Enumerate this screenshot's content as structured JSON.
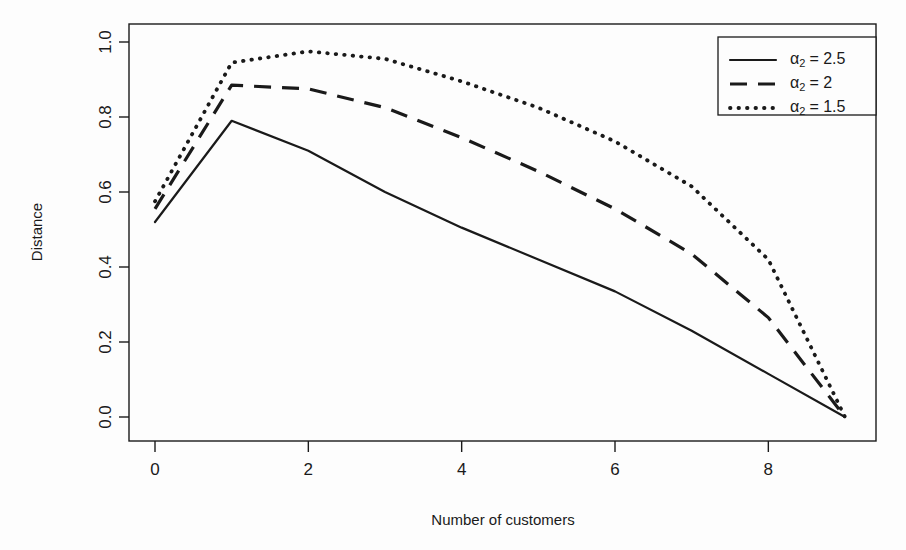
{
  "chart_data": {
    "type": "line",
    "title": "",
    "xlabel": "Number of customers",
    "ylabel": "Distance",
    "xlim": [
      0,
      9
    ],
    "ylim": [
      0.0,
      1.0
    ],
    "xticks": [
      0,
      2,
      4,
      6,
      8
    ],
    "xticklabels": [
      "0",
      "2",
      "4",
      "6",
      "8"
    ],
    "yticks": [
      0.0,
      0.2,
      0.4,
      0.6,
      0.8,
      1.0
    ],
    "yticklabels": [
      "0.0",
      "0.2",
      "0.4",
      "0.6",
      "0.8",
      "1.0"
    ],
    "grid": false,
    "legend_position": "top-right",
    "x": [
      0,
      1,
      2,
      3,
      4,
      5,
      6,
      7,
      8,
      9
    ],
    "series": [
      {
        "name": "alpha_2 = 2.5",
        "label_prefix": "α",
        "label_sub": "2",
        "label_suffix": "= 2.5",
        "linestyle": "solid",
        "color": "#1a1a1a",
        "values": [
          0.52,
          0.79,
          0.71,
          0.6,
          0.505,
          0.42,
          0.335,
          0.23,
          0.115,
          0.0
        ]
      },
      {
        "name": "alpha_2 = 2",
        "label_prefix": "α",
        "label_sub": "2",
        "label_suffix": "= 2",
        "linestyle": "dashed",
        "color": "#1a1a1a",
        "values": [
          0.555,
          0.885,
          0.875,
          0.825,
          0.745,
          0.655,
          0.555,
          0.435,
          0.265,
          0.0
        ]
      },
      {
        "name": "alpha_2 = 1.5",
        "label_prefix": "α",
        "label_sub": "2",
        "label_suffix": "= 1.5",
        "linestyle": "dotted",
        "color": "#1a1a1a",
        "values": [
          0.575,
          0.945,
          0.975,
          0.955,
          0.895,
          0.825,
          0.735,
          0.615,
          0.42,
          0.0
        ]
      }
    ]
  },
  "axes": {
    "xlabel": "Number of customers",
    "ylabel": "Distance"
  },
  "legend": {
    "entries": [
      {
        "label_prefix": "α",
        "label_sub": "2",
        "label_suffix": "= 2.5",
        "linestyle": "solid"
      },
      {
        "label_prefix": "α",
        "label_sub": "2",
        "label_suffix": "= 2",
        "linestyle": "dashed"
      },
      {
        "label_prefix": "α",
        "label_sub": "2",
        "label_suffix": "= 1.5",
        "linestyle": "dotted"
      }
    ]
  }
}
